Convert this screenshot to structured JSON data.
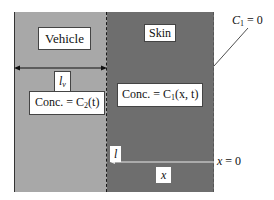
{
  "diagram": {
    "regions": {
      "vehicle": {
        "label": "Vehicle",
        "concentration_prefix": "Conc. = C",
        "concentration_sub": "2",
        "concentration_args": "(t)",
        "thickness_symbol": "l",
        "thickness_sub": "v",
        "fill_color": "#a8a8a8"
      },
      "skin": {
        "label": "Skin",
        "concentration_prefix": "Conc. = C",
        "concentration_sub": "1",
        "concentration_args": "(x, t)",
        "thickness_symbol": "l",
        "coordinate_symbol": "x",
        "fill_color": "#6e6e6e"
      }
    },
    "boundary_condition": {
      "prefix": "C",
      "sub": "1",
      "suffix": " = 0"
    },
    "origin_label": {
      "symbol": "x",
      "suffix": " = 0"
    }
  }
}
